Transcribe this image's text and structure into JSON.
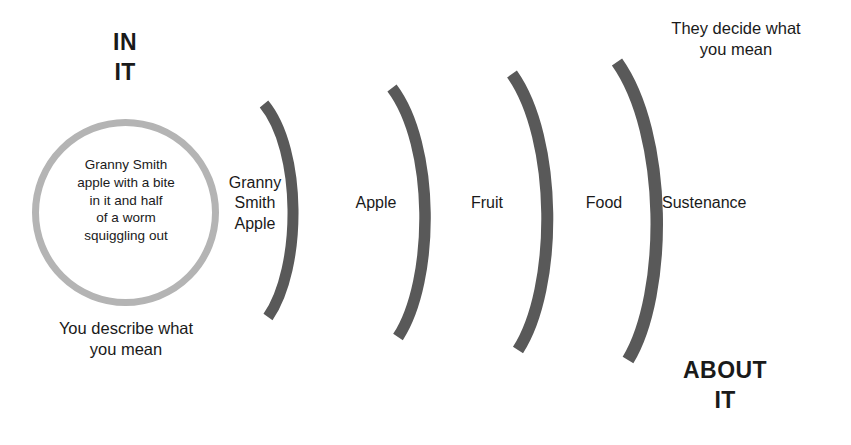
{
  "diagram": {
    "colors": {
      "background": "#ffffff",
      "circle_stroke": "#b4b4b4",
      "arc_stroke": "#595959",
      "text": "#1a1a1a"
    },
    "poles": {
      "left": "IN\nIT",
      "right": "ABOUT\nIT"
    },
    "captions": {
      "left": "You describe what\nyou mean",
      "right": "They decide what\nyou mean"
    },
    "concrete": {
      "shape": "circle",
      "text": "Granny Smith\napple with a bite\nin it and half\nof a worm\nsquiggling out"
    },
    "arcs": [
      {
        "label": "Granny\nSmith\nApple",
        "index": 1
      },
      {
        "label": "Apple",
        "index": 2
      },
      {
        "label": "Fruit",
        "index": 3
      },
      {
        "label": "Food",
        "index": 4
      },
      {
        "label": "Sustenance",
        "index": 5
      }
    ]
  }
}
